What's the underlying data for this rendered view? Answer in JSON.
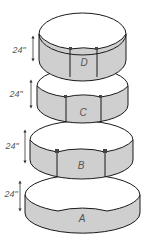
{
  "diagram": {
    "colors": {
      "band_fill": "#cfcfcf",
      "outline": "#1a1a1a",
      "label": "#555555",
      "background": "#ffffff"
    },
    "rings": [
      {
        "label": "D",
        "height_label": "24\""
      },
      {
        "label": "C",
        "height_label": "24\""
      },
      {
        "label": "B",
        "height_label": "24\""
      },
      {
        "label": "A",
        "height_label": "24\""
      }
    ]
  }
}
